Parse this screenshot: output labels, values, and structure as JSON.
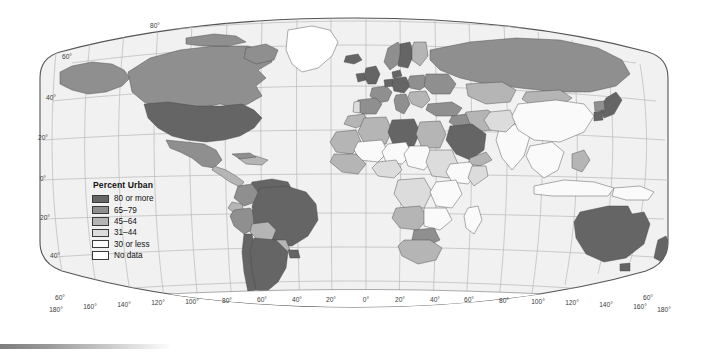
{
  "figure": {
    "projection": "robinson",
    "ocean_color": "#f1f1f1",
    "border_color": "#555555",
    "graticule_color": "#b9b9b9"
  },
  "legend": {
    "title": "Percent Urban",
    "entries": [
      {
        "label": "80 or more",
        "color": "#656565",
        "class_key": "c80"
      },
      {
        "label": "65–79",
        "color": "#8f8f8f",
        "class_key": "c65"
      },
      {
        "label": "45–64",
        "color": "#b5b5b5",
        "class_key": "c45"
      },
      {
        "label": "31–44",
        "color": "#dcdcdc",
        "class_key": "c31"
      },
      {
        "label": "30 or less",
        "color": "#fafafa",
        "class_key": "c30"
      },
      {
        "label": "No data",
        "color": "#ffffff",
        "class_key": "cnd"
      }
    ]
  },
  "graticule": {
    "latitude_labels_left": [
      "80°",
      "60°",
      "40°",
      "20°",
      "0°",
      "20°",
      "40°"
    ],
    "latitude_corner_labels": [
      "60°",
      "60°"
    ],
    "longitude_labels": [
      "180°",
      "160°",
      "140°",
      "120°",
      "100°",
      "80°",
      "60°",
      "40°",
      "20°",
      "0°",
      "20°",
      "40°",
      "60°",
      "80°",
      "100°",
      "120°",
      "140°",
      "160°",
      "180°"
    ],
    "lat_top": "80°",
    "lat_60_left": "60°",
    "lat_40_left": "40°",
    "lat_20_left": "20°",
    "lat_0_left": "0°",
    "lat_20s_left": "20°",
    "lat_40s_left": "40°",
    "lat_60s_bl": "60°",
    "lat_60s_br": "60°"
  },
  "chart_data": {
    "type": "map",
    "title": "Percent Urban",
    "map_type": "choropleth",
    "projection": "Robinson",
    "value_unit": "percent urban population",
    "classes": [
      {
        "label": "80 or more",
        "color": "#656565",
        "range": [
          80,
          100
        ]
      },
      {
        "label": "65–79",
        "color": "#8f8f8f",
        "range": [
          65,
          79
        ]
      },
      {
        "label": "45–64",
        "color": "#b5b5b5",
        "range": [
          45,
          64
        ]
      },
      {
        "label": "31–44",
        "color": "#dcdcdc",
        "range": [
          31,
          44
        ]
      },
      {
        "label": "30 or less",
        "color": "#fafafa",
        "range": [
          0,
          30
        ]
      },
      {
        "label": "No data",
        "color": "#ffffff",
        "range": null
      }
    ],
    "regions": [
      {
        "name": "United States",
        "class": "80 or more"
      },
      {
        "name": "Canada",
        "class": "65–79"
      },
      {
        "name": "Mexico",
        "class": "65–79"
      },
      {
        "name": "Greenland",
        "class": "No data"
      },
      {
        "name": "Brazil",
        "class": "80 or more"
      },
      {
        "name": "Argentina",
        "class": "80 or more"
      },
      {
        "name": "Chile",
        "class": "80 or more"
      },
      {
        "name": "Venezuela",
        "class": "80 or more"
      },
      {
        "name": "Uruguay",
        "class": "80 or more"
      },
      {
        "name": "Colombia",
        "class": "65–79"
      },
      {
        "name": "Peru",
        "class": "65–79"
      },
      {
        "name": "Bolivia",
        "class": "45–64"
      },
      {
        "name": "Paraguay",
        "class": "45–64"
      },
      {
        "name": "Ecuador",
        "class": "45–64"
      },
      {
        "name": "United Kingdom",
        "class": "80 or more"
      },
      {
        "name": "Germany",
        "class": "80 or more"
      },
      {
        "name": "Netherlands",
        "class": "80 or more"
      },
      {
        "name": "Belgium",
        "class": "80 or more"
      },
      {
        "name": "Denmark",
        "class": "80 or more"
      },
      {
        "name": "Sweden",
        "class": "80 or more"
      },
      {
        "name": "Iceland",
        "class": "80 or more"
      },
      {
        "name": "France",
        "class": "65–79"
      },
      {
        "name": "Spain",
        "class": "65–79"
      },
      {
        "name": "Norway",
        "class": "65–79"
      },
      {
        "name": "Finland",
        "class": "45–64"
      },
      {
        "name": "Italy",
        "class": "65–79"
      },
      {
        "name": "Poland",
        "class": "65–79"
      },
      {
        "name": "Russia",
        "class": "65–79"
      },
      {
        "name": "Ukraine",
        "class": "65–79"
      },
      {
        "name": "Turkey",
        "class": "65–79"
      },
      {
        "name": "Portugal",
        "class": "31–44"
      },
      {
        "name": "Libya",
        "class": "80 or more"
      },
      {
        "name": "Saudi Arabia",
        "class": "80 or more"
      },
      {
        "name": "Algeria",
        "class": "45–64"
      },
      {
        "name": "Egypt",
        "class": "45–64"
      },
      {
        "name": "Morocco",
        "class": "45–64"
      },
      {
        "name": "South Africa",
        "class": "45–64"
      },
      {
        "name": "Nigeria",
        "class": "31–44"
      },
      {
        "name": "Ethiopia",
        "class": "30 or less"
      },
      {
        "name": "Kenya",
        "class": "30 or less"
      },
      {
        "name": "Tanzania",
        "class": "30 or less"
      },
      {
        "name": "Sudan",
        "class": "31–44"
      },
      {
        "name": "Botswana",
        "class": "65–79"
      },
      {
        "name": "India",
        "class": "30 or less"
      },
      {
        "name": "China",
        "class": "30 or less"
      },
      {
        "name": "Japan",
        "class": "80 or more"
      },
      {
        "name": "South Korea",
        "class": "80 or more"
      },
      {
        "name": "North Korea",
        "class": "65–79"
      },
      {
        "name": "Mongolia",
        "class": "45–64"
      },
      {
        "name": "Kazakhstan",
        "class": "45–64"
      },
      {
        "name": "Iran",
        "class": "45–64"
      },
      {
        "name": "Iraq",
        "class": "65–79"
      },
      {
        "name": "Indonesia",
        "class": "30 or less"
      },
      {
        "name": "Thailand",
        "class": "30 or less"
      },
      {
        "name": "Vietnam",
        "class": "30 or less"
      },
      {
        "name": "Philippines",
        "class": "45–64"
      },
      {
        "name": "Malaysia",
        "class": "45–64"
      },
      {
        "name": "Australia",
        "class": "80 or more"
      },
      {
        "name": "New Zealand",
        "class": "80 or more"
      },
      {
        "name": "Papua New Guinea",
        "class": "30 or less"
      }
    ]
  }
}
